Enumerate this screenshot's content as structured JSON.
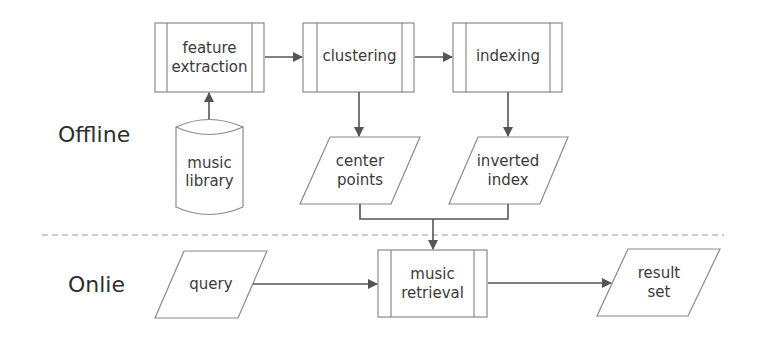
{
  "sections": {
    "offline": "Offline",
    "online": "Onlie"
  },
  "nodes": {
    "feature_extraction": {
      "line1": "feature",
      "line2": "extraction",
      "shape": "predefined-process"
    },
    "clustering": {
      "line1": "clustering",
      "shape": "predefined-process"
    },
    "indexing": {
      "line1": "indexing",
      "shape": "predefined-process"
    },
    "music_library": {
      "line1": "music",
      "line2": "library",
      "shape": "cylinder"
    },
    "center_points": {
      "line1": "center",
      "line2": "points",
      "shape": "parallelogram"
    },
    "inverted_index": {
      "line1": "inverted",
      "line2": "index",
      "shape": "parallelogram"
    },
    "query": {
      "line1": "query",
      "shape": "parallelogram"
    },
    "music_retrieval": {
      "line1": "music",
      "line2": "retrieval",
      "shape": "predefined-process"
    },
    "result_set": {
      "line1": "result",
      "line2": "set",
      "shape": "parallelogram"
    }
  },
  "edges": [
    {
      "from": "music_library",
      "to": "feature_extraction"
    },
    {
      "from": "feature_extraction",
      "to": "clustering"
    },
    {
      "from": "clustering",
      "to": "indexing"
    },
    {
      "from": "clustering",
      "to": "center_points"
    },
    {
      "from": "indexing",
      "to": "inverted_index"
    },
    {
      "from": "center_points",
      "to": "music_retrieval"
    },
    {
      "from": "inverted_index",
      "to": "music_retrieval"
    },
    {
      "from": "query",
      "to": "music_retrieval"
    },
    {
      "from": "music_retrieval",
      "to": "result_set"
    }
  ],
  "colors": {
    "stroke": "#8a8a8a",
    "arrow": "#555555",
    "text": "#3a3a3a",
    "divider": "#9a9a9a"
  }
}
